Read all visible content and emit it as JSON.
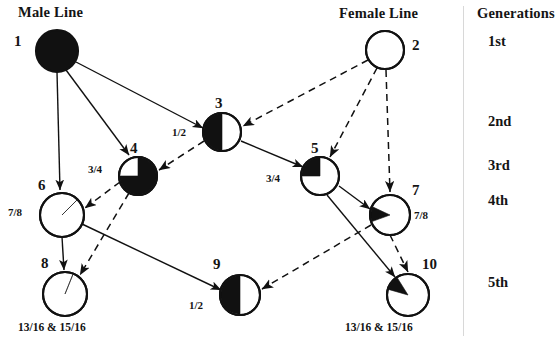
{
  "diagram": {
    "title_male": "Male Line",
    "title_female": "Female Line",
    "title_generations": "Generations",
    "background": "#ffffff",
    "ink": "#111111",
    "divider_color": "#d8d8d8"
  },
  "headers": [
    {
      "id": "male-line",
      "label": "Male Line",
      "x": 18,
      "y": 4
    },
    {
      "id": "female-line",
      "label": "Female Line",
      "x": 339,
      "y": 5
    },
    {
      "id": "generations",
      "label": "Generations",
      "x": 477,
      "y": 5
    }
  ],
  "generations": [
    {
      "id": "gen-1",
      "label": "1st",
      "x": 488,
      "y": 33
    },
    {
      "id": "gen-2",
      "label": "2nd",
      "x": 488,
      "y": 113
    },
    {
      "id": "gen-3",
      "label": "3rd",
      "x": 488,
      "y": 157
    },
    {
      "id": "gen-4",
      "label": "4th",
      "x": 488,
      "y": 192
    },
    {
      "id": "gen-5",
      "label": "5th",
      "x": 488,
      "y": 274
    }
  ],
  "nodes": [
    {
      "id": "node-1",
      "number": "1",
      "cx": 57,
      "cy": 51,
      "r": 21,
      "fill_kind": "full",
      "fraction_black": 1.0,
      "num_x": 14,
      "num_y": 33,
      "coefficient": "",
      "coef_x": 0,
      "coef_y": 0
    },
    {
      "id": "node-2",
      "number": "2",
      "cx": 385,
      "cy": 50,
      "r": 19,
      "fill_kind": "empty",
      "fraction_black": 0.0,
      "num_x": 412,
      "num_y": 37,
      "coefficient": "",
      "coef_x": 0,
      "coef_y": 0
    },
    {
      "id": "node-3",
      "number": "3",
      "cx": 222,
      "cy": 132,
      "r": 19,
      "fill_kind": "half-left",
      "fraction_black": 0.5,
      "num_x": 215,
      "num_y": 95,
      "coefficient": "1/2",
      "coef_x": 172,
      "coef_y": 126
    },
    {
      "id": "node-4",
      "number": "4",
      "cx": 138,
      "cy": 176,
      "r": 19,
      "fill_kind": "three-quarter",
      "fraction_black": 0.75,
      "num_x": 130,
      "num_y": 140,
      "coefficient": "3/4",
      "coef_x": 88,
      "coef_y": 163
    },
    {
      "id": "node-5",
      "number": "5",
      "cx": 320,
      "cy": 176,
      "r": 19,
      "fill_kind": "quarter-upper-left",
      "fraction_black": 0.25,
      "num_x": 311,
      "num_y": 140,
      "coefficient": "3/4",
      "coef_x": 266,
      "coef_y": 172
    },
    {
      "id": "node-6",
      "number": "6",
      "cx": 62,
      "cy": 215,
      "r": 22,
      "fill_kind": "seven-eighths",
      "fraction_black": 0.875,
      "num_x": 38,
      "num_y": 177,
      "coefficient": "7/8",
      "coef_x": 8,
      "coef_y": 206
    },
    {
      "id": "node-7",
      "number": "7",
      "cx": 390,
      "cy": 215,
      "r": 20,
      "fill_kind": "eighth-wedge-left",
      "fraction_black": 0.125,
      "num_x": 412,
      "num_y": 182,
      "coefficient": "7/8",
      "coef_x": 414,
      "coef_y": 209
    },
    {
      "id": "node-8",
      "number": "8",
      "cx": 65,
      "cy": 294,
      "r": 22,
      "fill_kind": "fifteen-sixteenths",
      "fraction_black": 0.9375,
      "num_x": 41,
      "num_y": 255,
      "coefficient": "13/16 & 15/16",
      "coef_x": 18,
      "coef_y": 321
    },
    {
      "id": "node-9",
      "number": "9",
      "cx": 240,
      "cy": 295,
      "r": 20,
      "fill_kind": "half-left",
      "fraction_black": 0.5,
      "num_x": 213,
      "num_y": 256,
      "coefficient": "1/2",
      "coef_x": 189,
      "coef_y": 299
    },
    {
      "id": "node-10",
      "number": "10",
      "cx": 408,
      "cy": 295,
      "r": 21,
      "fill_kind": "sixteenth-wedge",
      "fraction_black": 0.0625,
      "num_x": 422,
      "num_y": 256,
      "coefficient": "13/16 & 15/16",
      "coef_x": 345,
      "coef_y": 321
    }
  ],
  "edges": [
    {
      "id": "e-1-6",
      "from": "1",
      "to": "6",
      "line": "solid",
      "x1": 57,
      "y1": 72,
      "x2": 60,
      "y2": 190
    },
    {
      "id": "e-1-4",
      "from": "1",
      "to": "4",
      "line": "solid",
      "x1": 66,
      "y1": 70,
      "x2": 129,
      "y2": 155
    },
    {
      "id": "e-1-3",
      "from": "1",
      "to": "3",
      "line": "solid",
      "x1": 76,
      "y1": 62,
      "x2": 203,
      "y2": 128
    },
    {
      "id": "e-2-3",
      "from": "2",
      "to": "3",
      "line": "dashed",
      "x1": 368,
      "y1": 60,
      "x2": 243,
      "y2": 126
    },
    {
      "id": "e-2-5",
      "from": "2",
      "to": "5",
      "line": "dashed",
      "x1": 377,
      "y1": 68,
      "x2": 330,
      "y2": 157
    },
    {
      "id": "e-2-7",
      "from": "2",
      "to": "7",
      "line": "dashed",
      "x1": 386,
      "y1": 70,
      "x2": 390,
      "y2": 192
    },
    {
      "id": "e-3-4",
      "from": "3",
      "to": "4",
      "line": "dashed",
      "x1": 204,
      "y1": 141,
      "x2": 159,
      "y2": 170
    },
    {
      "id": "e-3-5",
      "from": "3",
      "to": "5",
      "line": "solid",
      "x1": 241,
      "y1": 141,
      "x2": 303,
      "y2": 167
    },
    {
      "id": "e-4-6",
      "from": "4",
      "to": "6",
      "line": "dashed",
      "x1": 120,
      "y1": 182,
      "x2": 85,
      "y2": 208
    },
    {
      "id": "e-4-8",
      "from": "4",
      "to": "8",
      "line": "dashed",
      "x1": 129,
      "y1": 193,
      "x2": 80,
      "y2": 275
    },
    {
      "id": "e-5-7",
      "from": "5",
      "to": "7",
      "line": "solid",
      "x1": 339,
      "y1": 186,
      "x2": 370,
      "y2": 209
    },
    {
      "id": "e-5-10",
      "from": "5",
      "to": "10",
      "line": "solid",
      "x1": 327,
      "y1": 195,
      "x2": 395,
      "y2": 277
    },
    {
      "id": "e-6-8",
      "from": "6",
      "to": "8",
      "line": "solid",
      "x1": 62,
      "y1": 237,
      "x2": 64,
      "y2": 270
    },
    {
      "id": "e-6-9",
      "from": "6",
      "to": "9",
      "line": "solid",
      "x1": 82,
      "y1": 224,
      "x2": 221,
      "y2": 290
    },
    {
      "id": "e-7-9",
      "from": "7",
      "to": "9",
      "line": "dashed",
      "x1": 371,
      "y1": 225,
      "x2": 262,
      "y2": 289
    },
    {
      "id": "e-7-10",
      "from": "7",
      "to": "10",
      "line": "dashed",
      "x1": 390,
      "y1": 235,
      "x2": 408,
      "y2": 272
    }
  ]
}
